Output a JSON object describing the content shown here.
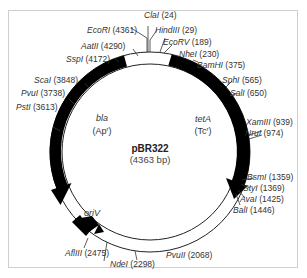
{
  "plasmid": {
    "name": "pBR322",
    "size_label": "(4363 bp)"
  },
  "genes": {
    "bla": {
      "name": "bla",
      "resistance": "(Ap",
      "res_sup": "r",
      "res_close": ")"
    },
    "tetA": {
      "name": "tetA",
      "resistance": "(Tc",
      "res_sup": "r",
      "res_close": ")"
    },
    "ori": {
      "name": "oriV"
    }
  },
  "sites": [
    {
      "enzyme": "ClaI",
      "pos": "(24)"
    },
    {
      "enzyme": "HindIII",
      "pos": "(29)"
    },
    {
      "enzyme": "EcoRV",
      "pos": "(189)"
    },
    {
      "enzyme": "NheI",
      "pos": "(230)"
    },
    {
      "enzyme": "BamHI",
      "pos": "(375)"
    },
    {
      "enzyme": "SphI",
      "pos": "(565)"
    },
    {
      "enzyme": "SalI",
      "pos": "(650)"
    },
    {
      "enzyme": "XamIII",
      "pos": "(939)"
    },
    {
      "enzyme": "NruI",
      "pos": "(974)"
    },
    {
      "enzyme": "BsmI",
      "pos": "(1359)"
    },
    {
      "enzyme": "StyI",
      "pos": "(1369)"
    },
    {
      "enzyme": "AvaI",
      "pos": "(1425)"
    },
    {
      "enzyme": "BalI",
      "pos": "(1446)"
    },
    {
      "enzyme": "PvuII",
      "pos": "(2068)"
    },
    {
      "enzyme": "NdeI",
      "pos": "(2298)"
    },
    {
      "enzyme": "AflIII",
      "pos": "(2475)"
    },
    {
      "enzyme": "PstI",
      "pos": "(3613)"
    },
    {
      "enzyme": "PvuI",
      "pos": "(3738)"
    },
    {
      "enzyme": "ScaI",
      "pos": "(3848)"
    },
    {
      "enzyme": "SspI",
      "pos": "(4172)"
    },
    {
      "enzyme": "AatII",
      "pos": "(4290)"
    },
    {
      "enzyme": "EcoRI",
      "pos": "(4361)"
    }
  ],
  "colors": {
    "ring_fill": "#ffffff",
    "ring_stroke": "#222222",
    "gene_fill": "#000000",
    "text": "#333333",
    "frame": "#cfcfcf"
  }
}
